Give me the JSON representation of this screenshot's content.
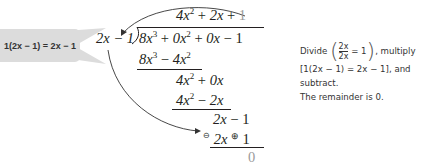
{
  "callout": {
    "text": "1(2x − 1) = 2x − 1",
    "background": "#dcdcdc"
  },
  "division": {
    "quotient": {
      "t1": "4x",
      "t1_exp": "2",
      "op1": "+",
      "t2": "2x",
      "op2": "+",
      "t3": "1"
    },
    "divisor": "2x − 1",
    "dividend": {
      "t1": "8x",
      "t1_exp": "3",
      "op1": "+",
      "t2": "0x",
      "t2_exp": "2",
      "op2": "+",
      "t3": "0x",
      "op3": "−",
      "t4": "1"
    },
    "steps": [
      {
        "text_a": "8x",
        "exp_a": "3",
        "op": "−",
        "text_b": "4x",
        "exp_b": "2"
      },
      {
        "text_a": "4x",
        "exp_a": "2",
        "op": "+",
        "text_b": "0x"
      },
      {
        "text_a": "4x",
        "exp_a": "2",
        "op": "−",
        "text_b": "2x"
      },
      {
        "text_a": "2x",
        "op": "−",
        "text_b": "1"
      },
      {
        "sign_left": "⊖",
        "text_a": "2x",
        "sign_mid": "⊕",
        "text_b": "1"
      }
    ],
    "remainder": "0",
    "highlight_color": "#9a9a9a"
  },
  "note": {
    "line1_prefix": "Divide",
    "frac_num": "2x",
    "frac_den": "2x",
    "frac_eq": "= 1",
    "line1_suffix": ", multiply",
    "line2": "[1(2x − 1) = 2x − 1], and",
    "line3": "subtract.",
    "line4": "The remainder is 0."
  }
}
